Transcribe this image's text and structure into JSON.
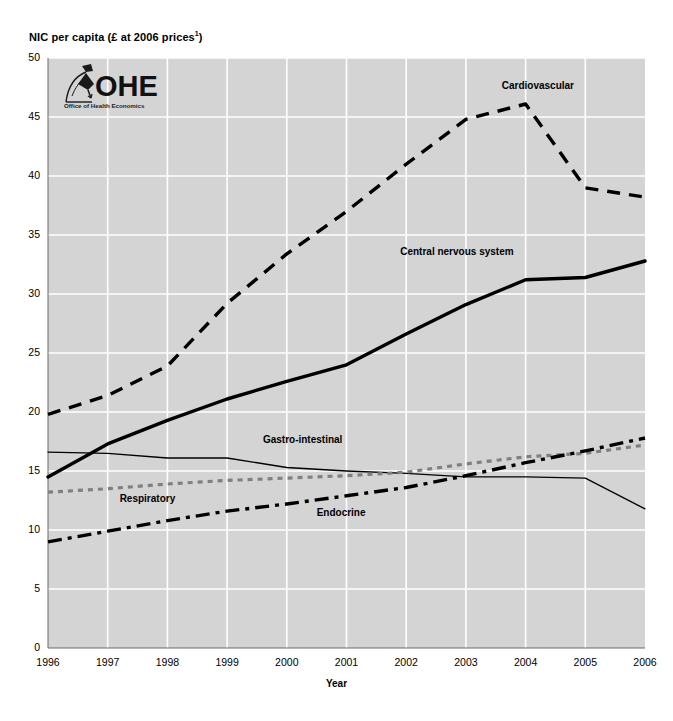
{
  "chart_data": {
    "type": "line",
    "title": "",
    "ylabel": "NIC per capita (£ at 2006 prices¹)",
    "ylabel_text": "NIC per capita (£ at 2006 prices",
    "ylabel_sup": "1",
    "ylabel_close": ")",
    "xlabel": "Year",
    "x": [
      1996,
      1997,
      1998,
      1999,
      2000,
      2001,
      2002,
      2003,
      2004,
      2005,
      2006
    ],
    "xticklabels": [
      "1996",
      "1997",
      "1998",
      "1999",
      "2000",
      "2001",
      "2002",
      "2003",
      "2004",
      "2005",
      "2006"
    ],
    "yticklabels": [
      "50",
      "45",
      "40",
      "35",
      "30",
      "25",
      "20",
      "15",
      "10",
      "5",
      "0"
    ],
    "yticks": [
      50,
      45,
      40,
      35,
      30,
      25,
      20,
      15,
      10,
      5,
      0
    ],
    "ylim": [
      0,
      50
    ],
    "xlim": [
      1996,
      2006
    ],
    "grid": true,
    "grid_color": "#ffffff",
    "plot_background": "#d4d4d4",
    "legend_position": "inline-annotations",
    "series": [
      {
        "name": "Cardiovascular",
        "style": "dashed",
        "color": "#000000",
        "values": [
          19.8,
          21.4,
          23.9,
          29.2,
          33.4,
          37.0,
          41.0,
          44.8,
          46.1,
          39.0,
          38.2
        ],
        "label_x": 2003.6,
        "label_y": 47.6
      },
      {
        "name": "Central nervous system",
        "style": "solid-thick",
        "color": "#000000",
        "values": [
          14.5,
          17.3,
          19.3,
          21.1,
          22.6,
          24.0,
          26.6,
          29.1,
          31.2,
          31.4,
          32.8
        ],
        "label_x": 2001.9,
        "label_y": 33.6
      },
      {
        "name": "Gastro-intestinal",
        "style": "solid-thin",
        "color": "#000000",
        "values": [
          16.6,
          16.5,
          16.1,
          16.1,
          15.3,
          15.0,
          14.8,
          14.5,
          14.5,
          14.4,
          11.8
        ],
        "label_x": 1999.6,
        "label_y": 17.6
      },
      {
        "name": "Respiratory",
        "style": "dotted",
        "color": "#808080",
        "values": [
          13.2,
          13.5,
          13.9,
          14.2,
          14.4,
          14.6,
          14.9,
          15.6,
          16.2,
          16.5,
          17.2
        ],
        "label_x": 1997.2,
        "label_y": 12.6
      },
      {
        "name": "Endocrine",
        "style": "dash-dot",
        "color": "#000000",
        "values": [
          9.0,
          9.9,
          10.8,
          11.6,
          12.2,
          12.9,
          13.6,
          14.6,
          15.7,
          16.7,
          17.8
        ],
        "label_x": 2000.5,
        "label_y": 11.4
      }
    ]
  },
  "logo": {
    "name": "OHE",
    "subtitle": "Office of Health Economics"
  }
}
